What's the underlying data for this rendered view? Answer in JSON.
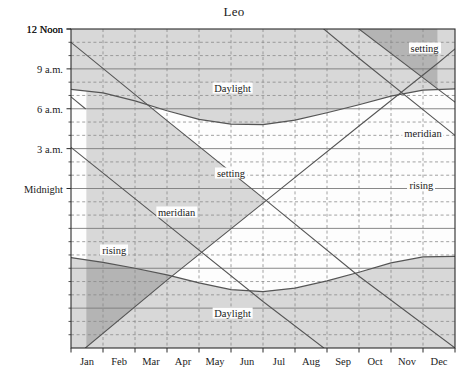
{
  "chart_data": {
    "type": "line",
    "title": "Leo",
    "xlabel": "",
    "ylabel": "",
    "grid": true,
    "legend_position": "inline-annotations",
    "x_tick_labels": [
      "Jan",
      "Feb",
      "Mar",
      "Apr",
      "May",
      "Jun",
      "Jul",
      "Aug",
      "Sep",
      "Oct",
      "Nov",
      "Dec"
    ],
    "y_tick_labels": [
      "12 Noon",
      "9 a.m.",
      "6 a.m.",
      "3 a.m.",
      "Midnight",
      "9 p.m.",
      "6 p.m.",
      "3 p.m.",
      "12 Noon"
    ],
    "y_tick_hours": [
      12,
      9,
      6,
      3,
      0,
      21,
      18,
      15,
      12
    ],
    "ylim_hours": [
      12,
      -12
    ],
    "xlim_months": [
      0,
      12
    ],
    "annotations": [
      {
        "text": "setting",
        "x_month": 11.05,
        "y_hour": 10.55
      },
      {
        "text": "Daylight",
        "x_month": 5.05,
        "y_hour": 7.55
      },
      {
        "text": "meridian",
        "x_month": 11.0,
        "y_hour": 4.2
      },
      {
        "text": "setting",
        "x_month": 5.0,
        "y_hour": 1.15
      },
      {
        "text": "rising",
        "x_month": 10.95,
        "y_hour": 0.3
      },
      {
        "text": "meridian",
        "x_month": 3.3,
        "y_hour": -1.8
      },
      {
        "text": "rising",
        "x_month": 1.35,
        "y_hour": -4.6
      },
      {
        "text": "Daylight",
        "x_month": 5.05,
        "y_hour": -9.4
      }
    ],
    "series": [
      {
        "name": "setting",
        "style": "solid-dark",
        "points": [
          {
            "x_month": 0.0,
            "y_hour": 11.0
          },
          {
            "x_month": 3.0,
            "y_hour": 5.1
          },
          {
            "x_month": 6.0,
            "y_hour": -0.7
          },
          {
            "x_month": 9.0,
            "y_hour": -6.6
          },
          {
            "x_month": 12.0,
            "y_hour": -12.0
          }
        ]
      },
      {
        "name": "setting-wrapped",
        "style": "solid-dark",
        "points": [
          {
            "x_month": 9.0,
            "y_hour": 12.0
          },
          {
            "x_month": 12.0,
            "y_hour": 6.5
          }
        ]
      },
      {
        "name": "meridian",
        "style": "solid-dark",
        "points": [
          {
            "x_month": 0.0,
            "y_hour": 3.1
          },
          {
            "x_month": 3.0,
            "y_hour": -2.7
          },
          {
            "x_month": 6.0,
            "y_hour": -8.5
          },
          {
            "x_month": 7.9,
            "y_hour": -12.0
          }
        ]
      },
      {
        "name": "meridian-wrapped",
        "style": "solid-dark",
        "points": [
          {
            "x_month": 7.9,
            "y_hour": 12.0
          },
          {
            "x_month": 9.0,
            "y_hour": 9.8
          },
          {
            "x_month": 12.0,
            "y_hour": 4.0
          }
        ]
      },
      {
        "name": "rising",
        "style": "solid-dark",
        "points": [
          {
            "x_month": 0.45,
            "y_hour": -12.0
          },
          {
            "x_month": 3.0,
            "y_hour": -6.9
          },
          {
            "x_month": 6.0,
            "y_hour": -1.1
          },
          {
            "x_month": 9.0,
            "y_hour": 4.7
          },
          {
            "x_month": 11.5,
            "y_hour": 9.5
          },
          {
            "x_month": 12.0,
            "y_hour": 10.5
          }
        ]
      },
      {
        "name": "rising-wrapped",
        "style": "solid-dark",
        "points": [
          {
            "x_month": 0.0,
            "y_hour": 6.9
          },
          {
            "x_month": 0.45,
            "y_hour": 6.0
          }
        ]
      },
      {
        "name": "sunrise",
        "style": "curve-dark",
        "points": [
          {
            "x_month": 0.0,
            "y_hour": 7.45
          },
          {
            "x_month": 1.0,
            "y_hour": 7.2
          },
          {
            "x_month": 2.0,
            "y_hour": 6.6
          },
          {
            "x_month": 3.0,
            "y_hour": 5.85
          },
          {
            "x_month": 4.0,
            "y_hour": 5.2
          },
          {
            "x_month": 5.0,
            "y_hour": 4.85
          },
          {
            "x_month": 6.0,
            "y_hour": 4.8
          },
          {
            "x_month": 7.0,
            "y_hour": 5.15
          },
          {
            "x_month": 8.0,
            "y_hour": 5.7
          },
          {
            "x_month": 9.0,
            "y_hour": 6.3
          },
          {
            "x_month": 10.0,
            "y_hour": 6.95
          },
          {
            "x_month": 11.0,
            "y_hour": 7.4
          },
          {
            "x_month": 12.0,
            "y_hour": 7.5
          }
        ]
      },
      {
        "name": "sunset",
        "style": "curve-dark",
        "points": [
          {
            "x_month": 0.0,
            "y_hour": -5.2
          },
          {
            "x_month": 1.0,
            "y_hour": -5.55
          },
          {
            "x_month": 2.0,
            "y_hour": -6.0
          },
          {
            "x_month": 3.0,
            "y_hour": -6.5
          },
          {
            "x_month": 4.0,
            "y_hour": -7.1
          },
          {
            "x_month": 5.0,
            "y_hour": -7.6
          },
          {
            "x_month": 6.0,
            "y_hour": -7.75
          },
          {
            "x_month": 7.0,
            "y_hour": -7.5
          },
          {
            "x_month": 8.0,
            "y_hour": -6.95
          },
          {
            "x_month": 9.0,
            "y_hour": -6.3
          },
          {
            "x_month": 10.0,
            "y_hour": -5.6
          },
          {
            "x_month": 11.0,
            "y_hour": -5.15
          },
          {
            "x_month": 12.0,
            "y_hour": -5.1
          }
        ]
      }
    ],
    "colors": {
      "daylight_fill": "#d8d8d8",
      "overlap_fill": "#b4b4b4",
      "night_fill": "#fdfdfd",
      "line": "#555555",
      "grid_solid": "#7a7a7a",
      "grid_dashed": "#8a8a8a",
      "axis": "#2b2b2b",
      "text": "#1a1a1a"
    }
  }
}
